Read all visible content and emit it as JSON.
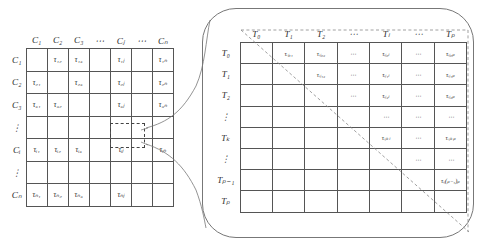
{
  "diagram": {
    "left_matrix": {
      "name": "city-pheromone-matrix",
      "col_headers": [
        "C₁",
        "C₂",
        "C₃",
        "⋯",
        "Cⱼ",
        "⋯",
        "Cₙ"
      ],
      "row_labels": [
        "C₁",
        "C₂",
        "C₃",
        "⋮",
        "Cᵢ",
        "⋮",
        "Cₙ"
      ],
      "cells": [
        [
          "",
          "τ₁₂",
          "τ₁₃",
          "",
          "τ₁ⱼ",
          "",
          "τ₁ₙ"
        ],
        [
          "τ₂₁",
          "",
          "τ₂₃",
          "",
          "τ₂ⱼ",
          "",
          "τ₂ₙ"
        ],
        [
          "τ₃₁",
          "τ₃₂",
          "",
          "",
          "τ₃ⱼ",
          "",
          "τ₃ₙ"
        ],
        [
          "",
          "",
          "",
          "",
          "",
          "",
          ""
        ],
        [
          "τᵢ₁",
          "τᵢ₂",
          "τᵢ₃",
          "",
          "τᵢⱼ",
          "",
          "τᵢₙ"
        ],
        [
          "",
          "",
          "",
          "",
          "",
          "",
          ""
        ],
        [
          "τₙ₁",
          "τₙ₂",
          "τₙ₃",
          "",
          "τₙⱼ",
          "",
          ""
        ]
      ],
      "highlighted_cell": "τᵢⱼ"
    },
    "right_matrix": {
      "name": "time-pheromone-matrix",
      "col_headers": [
        "T₀",
        "T₁",
        "T₂",
        "⋯",
        "Tₗ",
        "⋯",
        "Tₚ"
      ],
      "row_labels": [
        "T₀",
        "T₁",
        "T₂",
        "⋮",
        "Tₖ",
        "⋮",
        "Tₚ₋₁",
        "Tₚ"
      ],
      "cells": [
        [
          "",
          "τᵢⱼ₀₁",
          "τᵢⱼ₀₂",
          "⋯",
          "τᵢⱼ₀ₗ",
          "⋯",
          "τᵢⱼ₀ₚ"
        ],
        [
          "",
          "",
          "τᵢⱼ₁₂",
          "⋯",
          "τᵢⱼ₁ₗ",
          "⋯",
          "τᵢⱼ₁ₚ"
        ],
        [
          "",
          "",
          "",
          "⋯",
          "τᵢⱼ₂ₗ",
          "⋯",
          "τᵢⱼ₂ₚ"
        ],
        [
          "",
          "",
          "",
          "",
          "⋯",
          "⋯",
          "⋯"
        ],
        [
          "",
          "",
          "",
          "",
          "τᵢⱼₖₗ",
          "⋯",
          "τᵢⱼₖₚ"
        ],
        [
          "",
          "",
          "",
          "",
          "",
          "⋯",
          "⋯"
        ],
        [
          "",
          "",
          "",
          "",
          "",
          "",
          "τᵢⱼ(ₚ₋₁)ₚ"
        ],
        [
          "",
          "",
          "",
          "",
          "",
          "",
          ""
        ]
      ],
      "diagonal": "dashed-upper-triangular-divider"
    }
  }
}
